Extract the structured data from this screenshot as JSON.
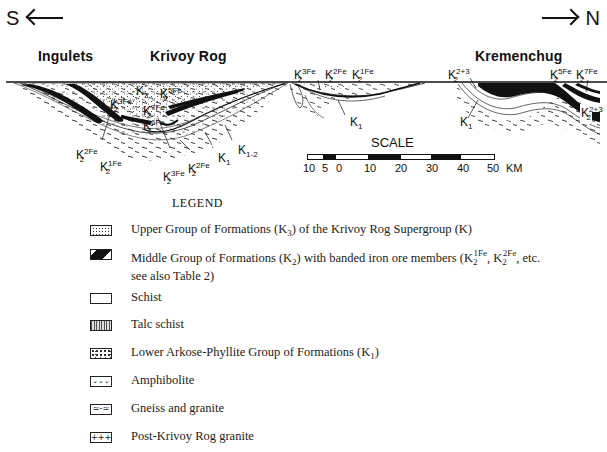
{
  "diagram": {
    "direction_left": "S",
    "direction_right": "N",
    "places": [
      {
        "name": "Ingulets"
      },
      {
        "name": "Krivoy Rog"
      },
      {
        "name": "Kremenchug"
      }
    ],
    "labels": {
      "k3": {
        "base": "K",
        "sub": "3",
        "sup": ""
      },
      "k2_5fe_a": {
        "base": "K",
        "sub": "2",
        "sup": "5Fe"
      },
      "k2_3fe_a": {
        "base": "K",
        "sub": "2",
        "sup": "3Fe"
      },
      "k2_7fe_a": {
        "base": "K",
        "sub": "2",
        "sup": "7Fe"
      },
      "k2_6fe": {
        "base": "K",
        "sub": "2",
        "sup": "6Fe"
      },
      "k2_2fe_a": {
        "base": "K",
        "sub": "2",
        "sup": "2Fe"
      },
      "k2_1fe_a": {
        "base": "K",
        "sub": "2",
        "sup": "1Fe"
      },
      "k2_3fe_b": {
        "base": "K",
        "sub": "2",
        "sup": "3Fe"
      },
      "k2_2fe_b": {
        "base": "K",
        "sub": "2",
        "sup": "2Fe"
      },
      "k1_a": {
        "base": "K",
        "sub": "1",
        "sup": ""
      },
      "k1_2": {
        "base": "K",
        "sub": "1-2",
        "sup": ""
      },
      "k2_3fe_c": {
        "base": "K",
        "sub": "2",
        "sup": "3Fe"
      },
      "k2_2fe_c": {
        "base": "K",
        "sub": "2",
        "sup": "2Fe"
      },
      "k2_1fe_c": {
        "base": "K",
        "sub": "2",
        "sup": "1Fe"
      },
      "k1_b": {
        "base": "K",
        "sub": "1",
        "sup": ""
      },
      "k2_23_a": {
        "base": "K",
        "sub": "2",
        "sup": "2+3"
      },
      "k1_c": {
        "base": "K",
        "sub": "1",
        "sup": ""
      },
      "k2_5fe_b": {
        "base": "K",
        "sub": "2",
        "sup": "5Fe"
      },
      "k2_7fe_b": {
        "base": "K",
        "sub": "2",
        "sup": "7Fe"
      },
      "k2_23_b": {
        "base": "K",
        "sub": "2",
        "sup": "2+3"
      }
    },
    "scale": {
      "title": "SCALE",
      "ticks": [
        "10",
        "5",
        "0",
        "10",
        "20",
        "30",
        "40",
        "50"
      ],
      "unit": "KM"
    }
  },
  "legend": {
    "title": "LEGEND",
    "items": [
      {
        "pattern": "dotted",
        "pre": "Upper Group of Formations (K",
        "sub": "3",
        "post": ") of the Krivoy Rog Supergroup (K)"
      },
      {
        "pattern": "black-wedge",
        "line1_pre": "Middle Group of Formations (K",
        "line1_sub": "2",
        "line1_mid": ") with banded iron ore members (K",
        "sup1": "1Fe",
        "sub1": "2",
        "sep": ", K",
        "sup2": "2Fe",
        "sub2": "2",
        "line1_post": ", etc.",
        "line2": "see also Table 2)"
      },
      {
        "pattern": "blank",
        "text": "Schist"
      },
      {
        "pattern": "vertical-lines",
        "text": "Talc schist"
      },
      {
        "pattern": "dots-dense",
        "pre": "Lower Arkose-Phyllite Group of Formations (K",
        "sub": "1",
        "post": ")"
      },
      {
        "pattern": "v-marks",
        "text": "Amphibolite"
      },
      {
        "pattern": "dashes",
        "text": "Gneiss and granite"
      },
      {
        "pattern": "crosses",
        "text": "Post-Krivoy Rog granite"
      }
    ]
  }
}
